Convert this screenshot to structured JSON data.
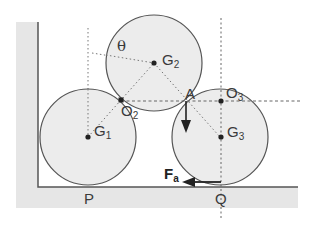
{
  "diagram": {
    "type": "statics free-body diagram: three cylinders against wall and floor",
    "colors": {
      "wall_fill": "#e6e6e6",
      "circle_fill": "#ececec",
      "stroke": "#555555",
      "dot": "#222222",
      "dotted_line": "#777777"
    },
    "labels": {
      "theta": "θ",
      "g1": "G",
      "g1_sub": "1",
      "g2": "G",
      "g2_sub": "2",
      "g3": "G",
      "g3_sub": "3",
      "o2": "O",
      "o2_sub": "2",
      "o3": "O",
      "o3_sub": "3",
      "a": "A",
      "p": "P",
      "q": "Q",
      "fa": "F",
      "fa_sub": "a"
    },
    "circles": [
      {
        "name": "G1",
        "cx": 88,
        "cy": 137,
        "r": 48
      },
      {
        "name": "G2",
        "cx": 154,
        "cy": 63,
        "r": 48
      },
      {
        "name": "G3",
        "cx": 220,
        "cy": 137,
        "r": 48
      }
    ],
    "points": {
      "O2": [
        121,
        100
      ],
      "A": [
        187,
        100
      ],
      "O3": [
        220,
        100
      ],
      "P": [
        88,
        186
      ],
      "Q": [
        220,
        186
      ]
    },
    "arrows": [
      {
        "name": "force-at-A",
        "direction": "down"
      },
      {
        "name": "Fa",
        "direction": "left"
      }
    ]
  }
}
